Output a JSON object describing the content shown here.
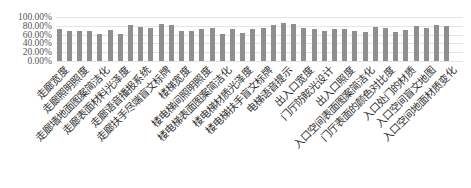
{
  "chart_data": {
    "type": "bar",
    "title": "",
    "xlabel": "",
    "ylabel": "",
    "ylim": [
      0,
      100
    ],
    "y_ticks": [
      "100.00%",
      "80.00%",
      "60.00%",
      "40.00%",
      "20.00%",
      "0.00%"
    ],
    "grid": true,
    "legend": "none",
    "bar_color": "#8f8f8f",
    "categories": [
      "走廊宽度",
      "",
      "走廊照明照度",
      "",
      "走廊墙地面图案简洁化",
      "",
      "走廊表面材料光泽度",
      "",
      "走廊语音播报系统",
      "",
      "走廊扶手尽端盲文标牌",
      "",
      "楼梯宽度",
      "",
      "楼电梯间照明照度",
      "",
      "楼电梯表面图案简洁化",
      "",
      "楼电梯材质光泽度",
      "",
      "楼电梯扶手盲文标牌",
      "",
      "电梯语音提示",
      "",
      "出入口宽度",
      "",
      "门厅防眩光设计",
      "",
      "出入口照度",
      "",
      "入口空间表面图案简洁化",
      "",
      "门厅表面的颜色对比度",
      "",
      "入口处门的材质",
      "",
      "入口空间盲文地图",
      "",
      "入口空间地面材质变化"
    ],
    "values": [
      72,
      69,
      69,
      69,
      62,
      71,
      62,
      81,
      78,
      76,
      83,
      81,
      69,
      68,
      72,
      74,
      62,
      72,
      64,
      72,
      76,
      81,
      87,
      84,
      75,
      72,
      69,
      72,
      73,
      69,
      65,
      78,
      76,
      66,
      70,
      80,
      75,
      82,
      79
    ],
    "value_unit": "%"
  }
}
